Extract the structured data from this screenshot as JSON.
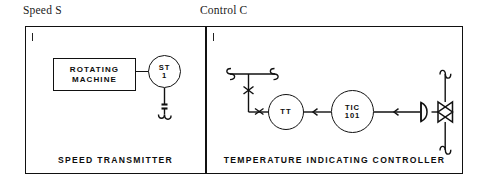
{
  "figure": {
    "captions": {
      "left": "Speed S",
      "right": "Control C"
    }
  },
  "panels": [
    {
      "id": "speed-transmitter",
      "label": "SPEED TRANSMITTER",
      "corner_mark": "1",
      "elements": {
        "equipment_box": {
          "line1": "ROTATING",
          "line2": "MACHINE"
        },
        "instrument_bubble": {
          "tag": "ST",
          "number": "1"
        }
      }
    },
    {
      "id": "temperature-indicating-controller",
      "label": "TEMPERATURE  INDICATING  CONTROLLER",
      "corner_mark": "1",
      "elements": {
        "transmitter_bubble": {
          "tag": "TT",
          "number": ""
        },
        "controller_bubble": {
          "tag": "TIC",
          "number": "101"
        },
        "final_element": "control-valve-with-diaphragm-actuator"
      }
    }
  ],
  "colors": {
    "line": "#111111",
    "background": "#ffffff",
    "text": "#0d0d0d"
  }
}
